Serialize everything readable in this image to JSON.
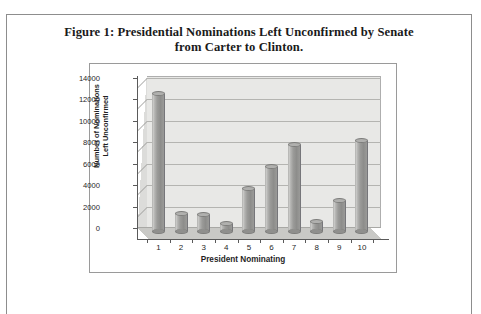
{
  "figure": {
    "caption_line1": "Figure 1:  Presidential Nominations Left Unconfirmed by Senate",
    "caption_line2": "from Carter to Clinton."
  },
  "chart_data": {
    "type": "bar",
    "title": "Figure 1:  Presidential Nominations Left Unconfirmed by Senate from Carter to Clinton.",
    "xlabel": "President Nominating",
    "ylabel_line1": "Number of Nominations",
    "ylabel_line2": "Left Unconfirmed",
    "categories": [
      "1",
      "2",
      "3",
      "4",
      "5",
      "6",
      "7",
      "8",
      "9",
      "10"
    ],
    "values": [
      12800,
      1600,
      1500,
      700,
      3900,
      5950,
      8000,
      800,
      2800,
      8400
    ],
    "ylim": [
      0,
      14000
    ],
    "ytick_labels": [
      "0",
      "2000",
      "4000",
      "6000",
      "8000",
      "10000",
      "12000",
      "14000"
    ],
    "ytick_values": [
      0,
      2000,
      4000,
      6000,
      8000,
      10000,
      12000,
      14000
    ],
    "grid": true,
    "legend": "none",
    "style": "3d-cylinder",
    "series_name": "Nominations Left Unconfirmed",
    "colors": {
      "bar_fill": "#9b9b99",
      "plot_background": "#e8e8e6",
      "floor": "#c9c9c6",
      "gridline": "#b4b4b1",
      "axis": "#5a5a5a",
      "text": "#1f1f1f"
    }
  }
}
